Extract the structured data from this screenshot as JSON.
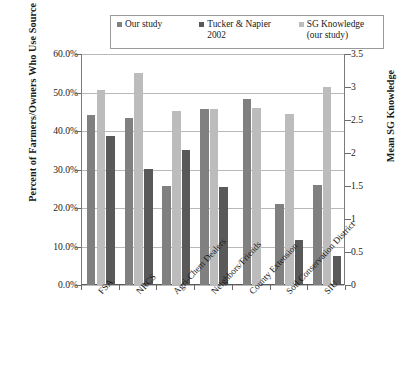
{
  "chart_data": {
    "type": "bar",
    "title": "",
    "xlabel": "",
    "ylabel": "Percent of Farmers/Owners\nWho Use Source",
    "y2label": "Mean SG Knowledge",
    "ylim": [
      0,
      60
    ],
    "y2lim": [
      0,
      3.5
    ],
    "ytick_labels": [
      "60.0%",
      "50.0%",
      "40.0%",
      "30.0%",
      "20.0%",
      "10.0%",
      "0.0%"
    ],
    "ytick_values": [
      60,
      50,
      40,
      30,
      20,
      10,
      0
    ],
    "y2tick_labels": [
      "3.5",
      "3",
      "2.5",
      "2",
      "1.5",
      "1",
      "0.5",
      "0"
    ],
    "y2tick_values": [
      3.5,
      3,
      2.5,
      2,
      1.5,
      1,
      0.5,
      0
    ],
    "grid": true,
    "legend_position": "top-center",
    "categories": [
      "FSA",
      "NRCS",
      "Agri-Chem Dealers",
      "Neighbors/Friends",
      "County Extension",
      "Soil Conservation District",
      "SIU"
    ],
    "series": [
      {
        "name": "Our study",
        "axis": "left",
        "unit": "percent",
        "color": "#808080",
        "values": [
          44.2,
          43.5,
          25.8,
          45.7,
          48.3,
          21.0,
          26.0
        ]
      },
      {
        "name": "Tucker & Napier\n2002",
        "axis": "left",
        "unit": "percent",
        "color": "#595959",
        "values": [
          38.7,
          30.2,
          35.0,
          25.5,
          null,
          11.7,
          7.5
        ]
      },
      {
        "name": "SG Knowledge\n(our study)",
        "axis": "right",
        "unit": "mean",
        "color": "#bcbcbc",
        "values": [
          2.95,
          3.21,
          2.63,
          2.67,
          2.68,
          2.59,
          3.0
        ],
        "values_as_left_percent": [
          50.6,
          55.0,
          45.1,
          45.7,
          46.0,
          44.3,
          51.4
        ]
      }
    ],
    "series_draw_order": [
      "Our study",
      "SG Knowledge (our study)",
      "Tucker & Napier 2002"
    ]
  },
  "legend": {
    "entries": [
      {
        "label": "Our study",
        "color": "#808080"
      },
      {
        "label": "Tucker & Napier\n2002",
        "color": "#595959"
      },
      {
        "label": "SG Knowledge\n(our study)",
        "color": "#bcbcbc"
      }
    ]
  },
  "axes": {
    "left_title": "Percent of Farmers/Owners\nWho Use Source",
    "right_title": "Mean SG Knowledge"
  },
  "colors": {
    "our_study": "#808080",
    "tucker_napier": "#595959",
    "sg_knowledge": "#bcbcbc",
    "gridline": "#b9b9b9",
    "axis": "#6a6a6a",
    "background": "#ffffff"
  }
}
